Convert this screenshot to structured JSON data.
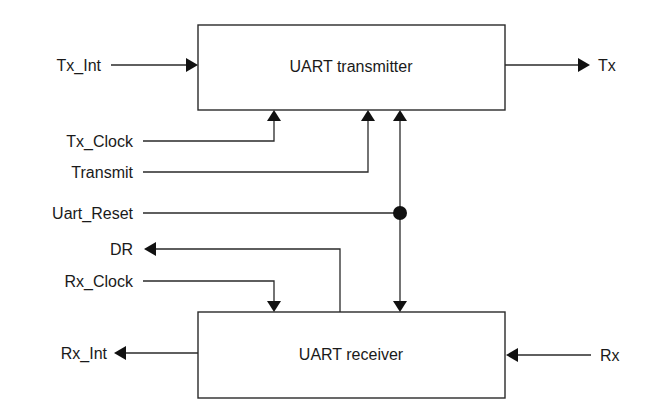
{
  "blocks": {
    "transmitter": {
      "label": "UART transmitter"
    },
    "receiver": {
      "label": "UART receiver"
    }
  },
  "signals": {
    "tx_int": "Tx_Int",
    "tx": "Tx",
    "tx_clock": "Tx_Clock",
    "transmit": "Transmit",
    "uart_reset": "Uart_Reset",
    "dr": "DR",
    "rx_clock": "Rx_Clock",
    "rx_int": "Rx_Int",
    "rx": "Rx"
  },
  "colors": {
    "line": "#2a2a2a",
    "text": "#1a1a1a",
    "background": "#ffffff"
  }
}
